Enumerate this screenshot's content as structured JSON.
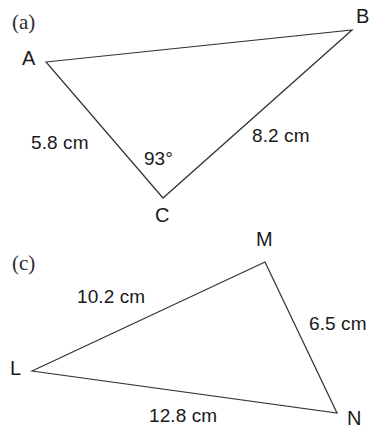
{
  "figure": {
    "background_color": "#ffffff",
    "stroke_color": "#333333",
    "parts": [
      {
        "id": "a",
        "part_label": "(a)",
        "part_label_pos": {
          "x": 12,
          "y": 12
        },
        "shape": "triangle",
        "vertices": [
          {
            "name": "A",
            "x": 46,
            "y": 62,
            "label_x": 22,
            "label_y": 48
          },
          {
            "name": "B",
            "x": 352,
            "y": 30,
            "label_x": 356,
            "label_y": 6
          },
          {
            "name": "C",
            "x": 163,
            "y": 198,
            "label_x": 155,
            "label_y": 205
          }
        ],
        "sides": [
          {
            "from": "A",
            "to": "C",
            "length": "5.8 cm",
            "label_x": 31,
            "label_y": 133
          },
          {
            "from": "C",
            "to": "B",
            "length": "8.2 cm",
            "label_x": 252,
            "label_y": 126
          },
          {
            "from": "A",
            "to": "B",
            "length": "",
            "label_x": 0,
            "label_y": 0
          }
        ],
        "angles": [
          {
            "at": "C",
            "value": "93°",
            "label_x": 144,
            "label_y": 149
          }
        ]
      },
      {
        "id": "c",
        "part_label": "(c)",
        "part_label_pos": {
          "x": 12,
          "y": 253
        },
        "shape": "triangle",
        "vertices": [
          {
            "name": "L",
            "x": 32,
            "y": 371,
            "label_x": 10,
            "label_y": 358
          },
          {
            "name": "M",
            "x": 265,
            "y": 262,
            "label_x": 256,
            "label_y": 229
          },
          {
            "name": "N",
            "x": 337,
            "y": 413,
            "label_x": 347,
            "label_y": 408
          }
        ],
        "sides": [
          {
            "from": "L",
            "to": "M",
            "length": "10.2 cm",
            "label_x": 77,
            "label_y": 287
          },
          {
            "from": "M",
            "to": "N",
            "length": "6.5 cm",
            "label_x": 309,
            "label_y": 314
          },
          {
            "from": "L",
            "to": "N",
            "length": "12.8 cm",
            "label_x": 149,
            "label_y": 406
          }
        ],
        "angles": []
      }
    ]
  }
}
